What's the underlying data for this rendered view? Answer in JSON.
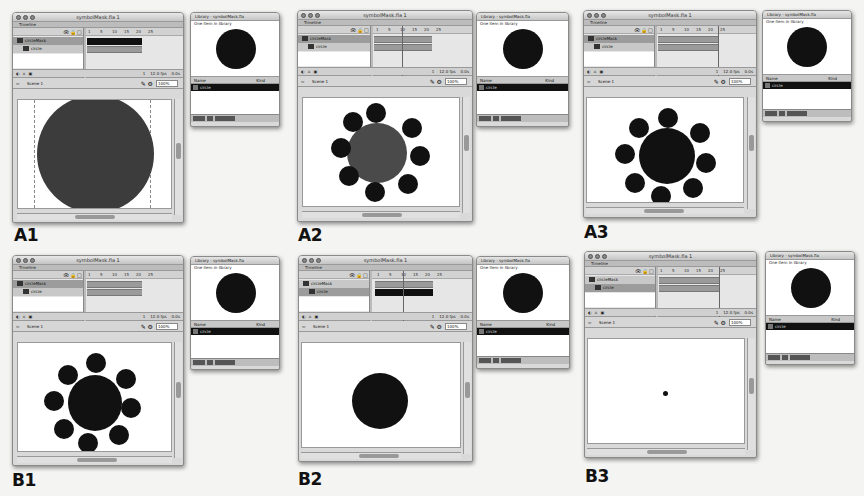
{
  "app": {
    "document_title": "symbolMask.fla 1",
    "timeline_label": "Timeline",
    "layers": [
      "circleMask",
      "circle"
    ],
    "frame_numbers": [
      "1",
      "5",
      "10",
      "15",
      "20",
      "25"
    ],
    "timeline_footer_left": "◐ ⌂ ▣",
    "fps": "12.0 fps",
    "current_frame": "1",
    "elapsed": "0.0s",
    "scene_label": "Scene 1",
    "back_arrow": "⇦",
    "edit_tools": "✎ ⚙",
    "zoom_level": "100%"
  },
  "library": {
    "title": "Library - symbolMask.fla",
    "count_text": "One item in library",
    "col_name": "Name",
    "col_kind": "Kind",
    "item_name": "circle",
    "item_kind": "Movie Clip"
  },
  "colors": {
    "fill_black": "#111111",
    "fill_gray": "#3c3c3c",
    "fill_gray_mid": "#4a4a4a"
  },
  "panels": [
    {
      "label": "A1",
      "description": "Single large gray circle on stage"
    },
    {
      "label": "A2",
      "description": "Gray center circle with eight black satellites"
    },
    {
      "label": "A3",
      "description": "Black center circle with eight black satellites"
    },
    {
      "label": "B1",
      "description": "Black center circle with eight black satellites"
    },
    {
      "label": "B2",
      "description": "Single black circle with handles"
    },
    {
      "label": "B3",
      "description": "Tiny dot on blank stage"
    }
  ]
}
